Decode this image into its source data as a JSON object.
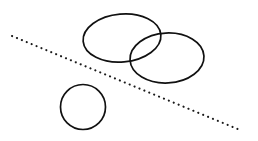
{
  "figure": {
    "background_color": "#ffffff",
    "stroke_color": "#111111",
    "width": 258,
    "height": 141
  },
  "chart_data": {
    "type": "scatter",
    "subtitle": "",
    "xlabel": "",
    "ylabel": "",
    "grid": false,
    "legend": "none",
    "xlim": [
      0,
      258
    ],
    "ylim": [
      0,
      141
    ],
    "axis_visible": false,
    "tick_labels": [],
    "annotations": [],
    "shapes": [
      {
        "name": "upper-left-ellipse",
        "kind": "ellipse",
        "cx": 122,
        "cy": 38,
        "rx": 39,
        "ry": 24,
        "rotation_deg": -5,
        "fill": "none",
        "stroke": "#111111",
        "stroke_width": 1.7
      },
      {
        "name": "right-ellipse",
        "kind": "ellipse",
        "cx": 167,
        "cy": 58,
        "rx": 37,
        "ry": 25,
        "rotation_deg": -3,
        "fill": "none",
        "stroke": "#111111",
        "stroke_width": 1.7
      },
      {
        "name": "lower-left-circle",
        "kind": "circle",
        "cx": 83,
        "cy": 107,
        "rx": 22.5,
        "ry": 22.5,
        "rotation_deg": 0,
        "fill": "none",
        "stroke": "#111111",
        "stroke_width": 1.7
      }
    ],
    "lines": [
      {
        "name": "dotted-diagonal-line",
        "kind": "dotted-line",
        "x1": 12,
        "y1": 36,
        "x2": 240,
        "y2": 130,
        "stroke": "#1a1a1a",
        "stroke_width": 2.1,
        "dash_pattern": "dotted",
        "dot_spacing": 5.2
      }
    ]
  }
}
